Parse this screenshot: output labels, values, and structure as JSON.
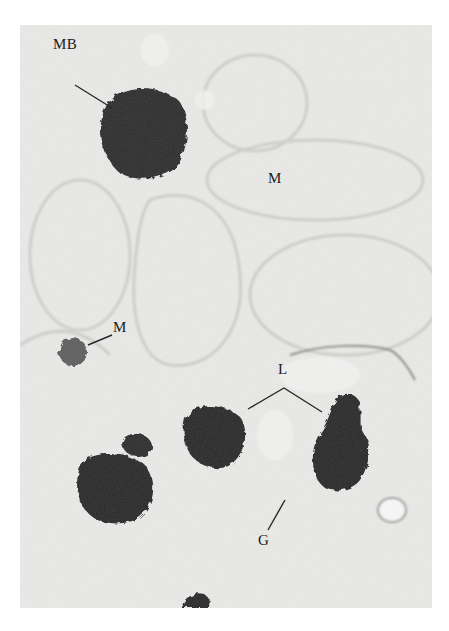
{
  "figure": {
    "labels": {
      "mb": "MB",
      "m_upper": "M",
      "m_lower": "M",
      "l": "L",
      "g": "G"
    },
    "colors": {
      "background": "#ebebea",
      "dense_body": "#2a2a2a",
      "small_m": "#5a5a5a",
      "membrane": "#c8c8c6"
    }
  }
}
